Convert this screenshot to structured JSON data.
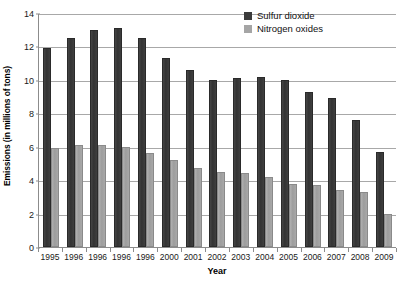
{
  "chart_data": {
    "type": "bar",
    "title": "",
    "xlabel": "Year",
    "ylabel": "Emissions (in millions of tons)",
    "categories": [
      "1995",
      "1996",
      "1996",
      "1996",
      "1996",
      "2000",
      "2001",
      "2002",
      "2003",
      "2004",
      "2005",
      "2006",
      "2007",
      "2008",
      "2009"
    ],
    "series": [
      {
        "name": "Sulfur dioxide",
        "color": "#3b3b3b",
        "values": [
          11.9,
          12.5,
          13.0,
          13.1,
          12.5,
          11.3,
          10.6,
          10.0,
          10.1,
          10.2,
          10.0,
          9.3,
          8.9,
          7.6,
          5.7
        ]
      },
      {
        "name": "Nitrogen oxides",
        "color": "#a5a5a5",
        "values": [
          5.9,
          6.1,
          6.1,
          6.0,
          5.6,
          5.2,
          4.7,
          4.5,
          4.4,
          4.2,
          3.8,
          3.7,
          3.4,
          3.3,
          2.0
        ]
      }
    ],
    "ylim": [
      0,
      14
    ],
    "yticks": [
      0,
      2,
      4,
      6,
      8,
      10,
      12,
      14
    ],
    "ytick_labels": [
      "0",
      "2",
      "4",
      "6",
      "8",
      "10",
      "12",
      "14"
    ],
    "grid": true,
    "legend_position": "top-right"
  },
  "legend": {
    "entries": [
      {
        "label": "Sulfur dioxide",
        "swatch": "so2"
      },
      {
        "label": "Nitrogen oxides",
        "swatch": "nox"
      }
    ]
  }
}
